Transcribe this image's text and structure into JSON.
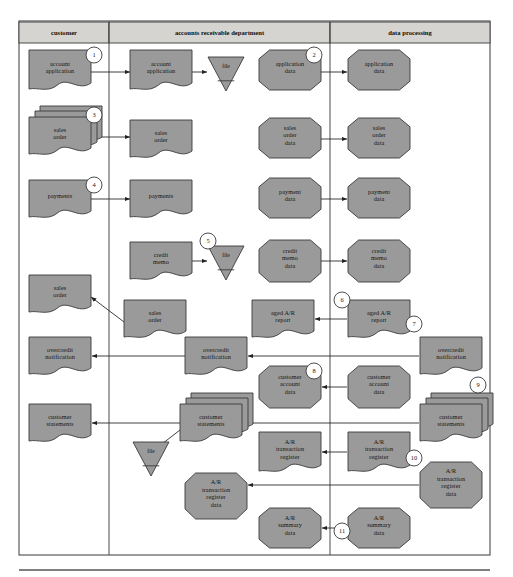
{
  "figure": {
    "background": "#ffffff",
    "frame": {
      "x": 19,
      "y": 21,
      "width": 471,
      "height": 534,
      "stroke": "#4a4a4a"
    },
    "baseline_rule": {
      "x1": 19,
      "y1": 570,
      "x2": 490,
      "y2": 570
    },
    "shape_fill": "#9a9a9a",
    "shape_stroke": "#3a3a3a",
    "header_fill": "#d6d4d0",
    "connector_color": "#2a2a2a"
  },
  "columns": [
    {
      "id": "customer",
      "label": "customer",
      "x": 19,
      "width": 90
    },
    {
      "id": "accounts-receivable",
      "label": "accounts receivable department",
      "x": 109,
      "width": 221
    },
    {
      "id": "data-processing",
      "label": "data processing",
      "x": 330,
      "width": 160
    }
  ],
  "header_band": {
    "y": 22,
    "height": 21
  },
  "shapes": [
    {
      "id": "s1",
      "name": "account-application-customer",
      "type": "document",
      "label": [
        "account",
        "application"
      ],
      "x": 29,
      "y": 50,
      "w": 62,
      "h": 40,
      "column": "customer"
    },
    {
      "id": "s2",
      "name": "account-application-ar",
      "type": "document",
      "label": [
        "account",
        "application"
      ],
      "x": 130,
      "y": 50,
      "w": 62,
      "h": 40,
      "column": "accounts-receivable"
    },
    {
      "id": "s3",
      "name": "file-account-application",
      "type": "file",
      "label": "file",
      "x": 208,
      "y": 57,
      "w": 36,
      "h": 34,
      "column": "accounts-receivable"
    },
    {
      "id": "s4",
      "name": "application-data-ar",
      "type": "data",
      "label": [
        "application",
        "data"
      ],
      "x": 259,
      "y": 50,
      "w": 62,
      "h": 40,
      "column": "accounts-receivable"
    },
    {
      "id": "s5",
      "name": "application-data-dp",
      "type": "data",
      "label": [
        "application",
        "data"
      ],
      "x": 348,
      "y": 50,
      "w": 62,
      "h": 40,
      "column": "data-processing"
    },
    {
      "id": "s6",
      "name": "sales-order-customer",
      "type": "multidocument",
      "label": [
        "sales",
        "order"
      ],
      "x": 29,
      "y": 117,
      "w": 62,
      "h": 38,
      "column": "customer"
    },
    {
      "id": "s7",
      "name": "sales-order-ar",
      "type": "document",
      "label": [
        "sales",
        "order"
      ],
      "x": 130,
      "y": 120,
      "w": 62,
      "h": 38,
      "column": "accounts-receivable"
    },
    {
      "id": "s8",
      "name": "sales-order-data-ar",
      "type": "data",
      "label": [
        "sales",
        "order",
        "data"
      ],
      "x": 259,
      "y": 118,
      "w": 62,
      "h": 40,
      "column": "accounts-receivable"
    },
    {
      "id": "s9",
      "name": "sales-order-data-dp",
      "type": "data",
      "label": [
        "sales",
        "order",
        "data"
      ],
      "x": 348,
      "y": 118,
      "w": 62,
      "h": 40,
      "column": "data-processing"
    },
    {
      "id": "s10",
      "name": "payments-customer",
      "type": "document",
      "label": [
        "payments"
      ],
      "x": 29,
      "y": 180,
      "w": 62,
      "h": 38,
      "column": "customer"
    },
    {
      "id": "s11",
      "name": "payments-ar",
      "type": "document",
      "label": [
        "payments"
      ],
      "x": 130,
      "y": 180,
      "w": 62,
      "h": 38,
      "column": "accounts-receivable"
    },
    {
      "id": "s12",
      "name": "payment-data-ar",
      "type": "data",
      "label": [
        "payment",
        "data"
      ],
      "x": 259,
      "y": 178,
      "w": 62,
      "h": 40,
      "column": "accounts-receivable"
    },
    {
      "id": "s13",
      "name": "payment-data-dp",
      "type": "data",
      "label": [
        "payment",
        "data"
      ],
      "x": 348,
      "y": 178,
      "w": 62,
      "h": 40,
      "column": "data-processing"
    },
    {
      "id": "s14",
      "name": "credit-memo-ar",
      "type": "document",
      "label": [
        "credit",
        "memo"
      ],
      "x": 130,
      "y": 242,
      "w": 62,
      "h": 38,
      "column": "accounts-receivable"
    },
    {
      "id": "s15",
      "name": "file-credit-memo",
      "type": "file",
      "label": "file",
      "x": 208,
      "y": 246,
      "w": 36,
      "h": 34,
      "column": "accounts-receivable"
    },
    {
      "id": "s16",
      "name": "credit-memo-data-ar",
      "type": "data",
      "label": [
        "credit",
        "memo",
        "data"
      ],
      "x": 259,
      "y": 240,
      "w": 62,
      "h": 42,
      "column": "accounts-receivable"
    },
    {
      "id": "s17",
      "name": "credit-memo-data-dp",
      "type": "data",
      "label": [
        "credit",
        "memo",
        "data"
      ],
      "x": 348,
      "y": 240,
      "w": 62,
      "h": 42,
      "column": "data-processing"
    },
    {
      "id": "s18",
      "name": "sales-order-returned-customer",
      "type": "document",
      "label": [
        "sales",
        "order"
      ],
      "x": 29,
      "y": 275,
      "w": 62,
      "h": 38,
      "column": "customer"
    },
    {
      "id": "s19",
      "name": "sales-order-returned-ar",
      "type": "document",
      "label": [
        "sales",
        "order"
      ],
      "x": 124,
      "y": 300,
      "w": 62,
      "h": 38,
      "column": "accounts-receivable"
    },
    {
      "id": "s20",
      "name": "aged-ar-report-ar",
      "type": "document",
      "label": [
        "aged A/R",
        "report"
      ],
      "x": 252,
      "y": 300,
      "w": 62,
      "h": 38,
      "column": "accounts-receivable"
    },
    {
      "id": "s21",
      "name": "aged-ar-report-dp",
      "type": "document",
      "label": [
        "aged A/R",
        "report"
      ],
      "x": 348,
      "y": 300,
      "w": 62,
      "h": 38,
      "column": "data-processing"
    },
    {
      "id": "s22",
      "name": "overcredit-notification-customer",
      "type": "document",
      "label": [
        "overcredit",
        "notification"
      ],
      "x": 29,
      "y": 337,
      "w": 62,
      "h": 38,
      "column": "customer"
    },
    {
      "id": "s23",
      "name": "overcredit-notification-ar",
      "type": "document",
      "label": [
        "overcredit",
        "notification"
      ],
      "x": 185,
      "y": 337,
      "w": 62,
      "h": 38,
      "column": "accounts-receivable"
    },
    {
      "id": "s24",
      "name": "overcredit-notification-dp",
      "type": "document",
      "label": [
        "overcredit",
        "notification"
      ],
      "x": 420,
      "y": 337,
      "w": 62,
      "h": 38,
      "column": "data-processing"
    },
    {
      "id": "s25",
      "name": "customer-account-data-ar",
      "type": "data",
      "label": [
        "customer",
        "account",
        "data"
      ],
      "x": 259,
      "y": 366,
      "w": 62,
      "h": 42,
      "column": "accounts-receivable"
    },
    {
      "id": "s26",
      "name": "customer-account-data-dp",
      "type": "data",
      "label": [
        "customer",
        "account",
        "data"
      ],
      "x": 348,
      "y": 366,
      "w": 62,
      "h": 42,
      "column": "data-processing"
    },
    {
      "id": "s27",
      "name": "customer-statements-customer",
      "type": "document",
      "label": [
        "customer",
        "statements"
      ],
      "x": 29,
      "y": 404,
      "w": 62,
      "h": 38,
      "column": "customer"
    },
    {
      "id": "s28",
      "name": "customer-statements-ar",
      "type": "multidocument",
      "label": [
        "customer",
        "statements"
      ],
      "x": 180,
      "y": 404,
      "w": 62,
      "h": 38,
      "column": "accounts-receivable"
    },
    {
      "id": "s29",
      "name": "customer-statements-dp",
      "type": "multidocument",
      "label": [
        "customer",
        "statements"
      ],
      "x": 420,
      "y": 404,
      "w": 62,
      "h": 38,
      "column": "data-processing"
    },
    {
      "id": "s30",
      "name": "file-customer-statements",
      "type": "file",
      "label": "file",
      "x": 133,
      "y": 442,
      "w": 36,
      "h": 34,
      "column": "accounts-receivable"
    },
    {
      "id": "s31",
      "name": "ar-transaction-register-ar",
      "type": "document",
      "label": [
        "A/R",
        "transaction",
        "register"
      ],
      "x": 259,
      "y": 432,
      "w": 62,
      "h": 40,
      "column": "accounts-receivable"
    },
    {
      "id": "s32",
      "name": "ar-transaction-register-dp",
      "type": "document",
      "label": [
        "A/R",
        "transaction",
        "register"
      ],
      "x": 348,
      "y": 432,
      "w": 62,
      "h": 40,
      "column": "data-processing"
    },
    {
      "id": "s33",
      "name": "ar-transaction-register-data-dp",
      "type": "data",
      "label": [
        "A/R",
        "transaction",
        "register",
        "data"
      ],
      "x": 420,
      "y": 462,
      "w": 62,
      "h": 46,
      "column": "data-processing"
    },
    {
      "id": "s34",
      "name": "ar-transaction-register-data-ar",
      "type": "data",
      "label": [
        "A/R",
        "transaction",
        "register",
        "data"
      ],
      "x": 185,
      "y": 473,
      "w": 62,
      "h": 46,
      "column": "accounts-receivable"
    },
    {
      "id": "s35",
      "name": "ar-summary-data-ar",
      "type": "data",
      "label": [
        "A/R",
        "summary",
        "data"
      ],
      "x": 259,
      "y": 508,
      "w": 62,
      "h": 40,
      "column": "accounts-receivable"
    },
    {
      "id": "s36",
      "name": "ar-summary-data-dp",
      "type": "data",
      "label": [
        "A/R",
        "summary",
        "data"
      ],
      "x": 348,
      "y": 508,
      "w": 62,
      "h": 40,
      "column": "data-processing"
    }
  ],
  "callouts": [
    {
      "id": "c1",
      "label": "1",
      "cx": 94,
      "cy": 55,
      "r": 8
    },
    {
      "id": "c2",
      "label": "2",
      "cx": 314,
      "cy": 55,
      "r": 8
    },
    {
      "id": "c3",
      "label": "3",
      "cx": 94,
      "cy": 115,
      "r": 8
    },
    {
      "id": "c4",
      "label": "4",
      "cx": 94,
      "cy": 185,
      "r": 8
    },
    {
      "id": "c5",
      "label": "5",
      "cx": 208,
      "cy": 241,
      "r": 8
    },
    {
      "id": "c6",
      "label": "6",
      "cx": 342,
      "cy": 300,
      "r": 8
    },
    {
      "id": "c7",
      "label": "7",
      "cx": 414,
      "cy": 324,
      "r": 8
    },
    {
      "id": "c8",
      "label": "8",
      "cx": 314,
      "cy": 371,
      "r": 8
    },
    {
      "id": "c9",
      "label": "9",
      "cx": 478,
      "cy": 385,
      "r": 8
    },
    {
      "id": "c10",
      "label": "10",
      "cx": 414,
      "cy": 458,
      "r": 8
    },
    {
      "id": "c11",
      "label": "11",
      "cx": 342,
      "cy": 531,
      "r": 8
    }
  ],
  "connectors": [
    {
      "id": "a1",
      "name": "arrow-account-application-to-ar",
      "points": "91,72 130,72",
      "arrow": "end"
    },
    {
      "id": "a2",
      "name": "arrow-account-application-to-file",
      "points": "192,72 207,72",
      "arrow": "end"
    },
    {
      "id": "a3",
      "name": "arrow-application-data-to-dp",
      "points": "321,72 347,72",
      "arrow": "end"
    },
    {
      "id": "a4",
      "name": "arrow-sales-order-to-ar",
      "points": "91,137 130,137",
      "arrow": "end"
    },
    {
      "id": "a5",
      "name": "arrow-sales-order-data-to-dp",
      "points": "321,139 347,139",
      "arrow": "end"
    },
    {
      "id": "a6",
      "name": "arrow-payments-to-ar",
      "points": "91,199 130,199",
      "arrow": "end"
    },
    {
      "id": "a7",
      "name": "arrow-payment-data-to-dp",
      "points": "321,199 347,199",
      "arrow": "end"
    },
    {
      "id": "a8",
      "name": "arrow-credit-memo-to-file",
      "points": "192,261 207,261",
      "arrow": "end"
    },
    {
      "id": "a9",
      "name": "arrow-credit-memo-data-to-dp",
      "points": "321,261 347,261",
      "arrow": "end"
    },
    {
      "id": "a10",
      "name": "arrow-sales-order-ar-to-customer",
      "points": "128,325 91,297",
      "arrow": "end"
    },
    {
      "id": "a11",
      "name": "arrow-aged-ar-report-dp-to-ar",
      "points": "347,319 315,319",
      "arrow": "end"
    },
    {
      "id": "a12",
      "name": "arrow-overcredit-notification-dp-to-ar",
      "points": "419,356 248,356",
      "arrow": "end"
    },
    {
      "id": "a13",
      "name": "arrow-overcredit-notification-ar-to-customer",
      "points": "185,356 92,356",
      "arrow": "end"
    },
    {
      "id": "a14",
      "name": "arrow-customer-account-data-dp-to-ar",
      "points": "347,387 322,387",
      "arrow": "end"
    },
    {
      "id": "a15",
      "name": "arrow-customer-statements-dp-to-ar",
      "points": "419,423 245,423",
      "arrow": "end"
    },
    {
      "id": "a16",
      "name": "arrow-customer-statements-ar-to-customer",
      "points": "180,423 92,423",
      "arrow": "end"
    },
    {
      "id": "a17",
      "name": "arrow-customer-statements-to-file",
      "points": "180,430 158,447",
      "arrow": "end"
    },
    {
      "id": "a18",
      "name": "arrow-ar-transaction-register-dp-to-ar",
      "points": "347,452 322,452",
      "arrow": "end"
    },
    {
      "id": "a19",
      "name": "arrow-ar-transaction-register-data-dp-to-ar",
      "points": "419,485 248,485",
      "arrow": "end"
    },
    {
      "id": "a20",
      "name": "arrow-ar-summary-data-dp-to-ar",
      "points": "347,528 322,528",
      "arrow": "end"
    }
  ]
}
